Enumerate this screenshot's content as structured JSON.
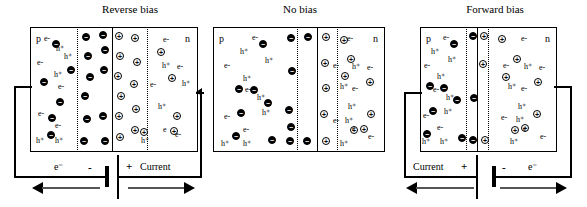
{
  "figure": {
    "panels": [
      {
        "id": "reverse-bias",
        "title": "Reverse bias",
        "p_label": "p",
        "n_label": "n",
        "box": {
          "x": 30,
          "y": 27,
          "w": 168,
          "h": 125
        },
        "depletion": {
          "left_line": 77,
          "junction": 112,
          "right_line": 147
        },
        "p_texts": [
          {
            "t": "e-",
            "x": 44,
            "y": 35
          },
          {
            "t": "h⁺",
            "x": 56,
            "y": 45
          },
          {
            "t": "h⁺",
            "x": 64,
            "y": 53
          },
          {
            "t": "e-",
            "x": 37,
            "y": 59
          },
          {
            "t": "h⁺",
            "x": 54,
            "y": 71
          },
          {
            "t": "e-",
            "x": 58,
            "y": 83
          },
          {
            "t": "e-",
            "x": 38,
            "y": 110
          },
          {
            "t": "e-",
            "x": 55,
            "y": 122
          },
          {
            "t": "h⁺",
            "x": 36,
            "y": 137
          },
          {
            "t": "h⁺",
            "x": 55,
            "y": 137
          }
        ],
        "n_texts": [
          {
            "t": "e-",
            "x": 163,
            "y": 36
          },
          {
            "t": "h⁺",
            "x": 162,
            "y": 62
          },
          {
            "t": "e-",
            "x": 177,
            "y": 63
          },
          {
            "t": "e-",
            "x": 150,
            "y": 81
          },
          {
            "t": "h⁺",
            "x": 182,
            "y": 80
          },
          {
            "t": "h⁺",
            "x": 158,
            "y": 103
          },
          {
            "t": "e",
            "x": 163,
            "y": 126
          },
          {
            "t": "h⁺",
            "x": 141,
            "y": 137
          },
          {
            "t": "e-",
            "x": 175,
            "y": 131
          }
        ],
        "neg_carriers": [
          {
            "x": 52,
            "y": 40
          },
          {
            "x": 67,
            "y": 66
          },
          {
            "x": 40,
            "y": 78
          },
          {
            "x": 56,
            "y": 98
          },
          {
            "x": 48,
            "y": 114
          },
          {
            "x": 47,
            "y": 131
          },
          {
            "x": 82,
            "y": 33
          },
          {
            "x": 84,
            "y": 52
          },
          {
            "x": 86,
            "y": 73
          },
          {
            "x": 81,
            "y": 92
          },
          {
            "x": 83,
            "y": 115
          },
          {
            "x": 80,
            "y": 137
          },
          {
            "x": 99,
            "y": 31
          },
          {
            "x": 101,
            "y": 46
          },
          {
            "x": 100,
            "y": 66
          },
          {
            "x": 99,
            "y": 112
          },
          {
            "x": 101,
            "y": 137
          }
        ],
        "pos_carriers": [
          {
            "x": 115,
            "y": 32
          },
          {
            "x": 116,
            "y": 52
          },
          {
            "x": 114,
            "y": 72
          },
          {
            "x": 117,
            "y": 92
          },
          {
            "x": 115,
            "y": 112
          },
          {
            "x": 116,
            "y": 133
          },
          {
            "x": 131,
            "y": 34
          },
          {
            "x": 133,
            "y": 58
          },
          {
            "x": 130,
            "y": 80
          },
          {
            "x": 132,
            "y": 105
          },
          {
            "x": 131,
            "y": 126
          },
          {
            "x": 140,
            "y": 128
          },
          {
            "x": 157,
            "y": 48
          },
          {
            "x": 168,
            "y": 74
          },
          {
            "x": 173,
            "y": 112
          },
          {
            "x": 170,
            "y": 127
          }
        ],
        "circuit": {
          "e_label": "e⁻",
          "minus": "-",
          "plus": "+",
          "current_label": "Current"
        }
      },
      {
        "id": "no-bias",
        "title": "No bias",
        "p_label": "p",
        "n_label": "n",
        "box": {
          "x": 213,
          "y": 27,
          "w": 172,
          "h": 125
        },
        "depletion": {
          "left_line": 297,
          "junction": 317,
          "right_line": 337
        },
        "p_texts": [
          {
            "t": "e-",
            "x": 252,
            "y": 34
          },
          {
            "t": "h⁺",
            "x": 240,
            "y": 48
          },
          {
            "t": "h⁺",
            "x": 265,
            "y": 57
          },
          {
            "t": "e-",
            "x": 224,
            "y": 62
          },
          {
            "t": "h⁺",
            "x": 243,
            "y": 75
          },
          {
            "t": "e-",
            "x": 245,
            "y": 86
          },
          {
            "t": "h⁺",
            "x": 257,
            "y": 94
          },
          {
            "t": "h⁺",
            "x": 262,
            "y": 109
          },
          {
            "t": "e-",
            "x": 224,
            "y": 113
          },
          {
            "t": "e-",
            "x": 243,
            "y": 126
          },
          {
            "t": "h⁺",
            "x": 221,
            "y": 140
          },
          {
            "t": "h⁺",
            "x": 243,
            "y": 140
          }
        ],
        "n_texts": [
          {
            "t": "e-",
            "x": 347,
            "y": 35
          },
          {
            "t": "h⁺",
            "x": 352,
            "y": 63
          },
          {
            "t": "e-",
            "x": 367,
            "y": 64
          },
          {
            "t": "e-",
            "x": 333,
            "y": 62
          },
          {
            "t": "h⁺",
            "x": 340,
            "y": 83
          },
          {
            "t": "e-",
            "x": 352,
            "y": 85
          },
          {
            "t": "h⁺",
            "x": 348,
            "y": 103
          },
          {
            "t": "e-",
            "x": 333,
            "y": 117
          },
          {
            "t": "h⁺",
            "x": 345,
            "y": 117
          },
          {
            "t": "e",
            "x": 352,
            "y": 125
          },
          {
            "t": "h⁺",
            "x": 340,
            "y": 140
          },
          {
            "t": "e-",
            "x": 368,
            "y": 133
          }
        ],
        "neg_carriers": [
          {
            "x": 259,
            "y": 40
          },
          {
            "x": 250,
            "y": 86
          },
          {
            "x": 264,
            "y": 99
          },
          {
            "x": 235,
            "y": 85
          },
          {
            "x": 237,
            "y": 109
          },
          {
            "x": 232,
            "y": 132
          },
          {
            "x": 268,
            "y": 136
          },
          {
            "x": 287,
            "y": 34
          },
          {
            "x": 288,
            "y": 67
          },
          {
            "x": 285,
            "y": 106
          },
          {
            "x": 287,
            "y": 123
          },
          {
            "x": 286,
            "y": 137
          },
          {
            "x": 304,
            "y": 33
          },
          {
            "x": 303,
            "y": 137
          }
        ],
        "pos_carriers": [
          {
            "x": 322,
            "y": 33
          },
          {
            "x": 321,
            "y": 59
          },
          {
            "x": 322,
            "y": 84
          },
          {
            "x": 320,
            "y": 110
          },
          {
            "x": 322,
            "y": 137
          },
          {
            "x": 340,
            "y": 36
          },
          {
            "x": 347,
            "y": 55
          },
          {
            "x": 341,
            "y": 72
          },
          {
            "x": 350,
            "y": 126
          },
          {
            "x": 360,
            "y": 125
          },
          {
            "x": 366,
            "y": 78
          },
          {
            "x": 367,
            "y": 110
          }
        ],
        "circuit": null
      },
      {
        "id": "forward-bias",
        "title": "Forward bias",
        "p_label": "p",
        "n_label": "n",
        "box": {
          "x": 420,
          "y": 27,
          "w": 137,
          "h": 125
        },
        "depletion": {
          "left_line": 466,
          "junction": 477,
          "right_line": 488
        },
        "p_texts": [
          {
            "t": "e-",
            "x": 443,
            "y": 34
          },
          {
            "t": "h⁺",
            "x": 431,
            "y": 48
          },
          {
            "t": "h⁺",
            "x": 448,
            "y": 56
          },
          {
            "t": "e-",
            "x": 424,
            "y": 62
          },
          {
            "t": "h⁺",
            "x": 437,
            "y": 73
          },
          {
            "t": "e-",
            "x": 433,
            "y": 86
          },
          {
            "t": "h⁺",
            "x": 446,
            "y": 94
          },
          {
            "t": "h⁺",
            "x": 444,
            "y": 108
          },
          {
            "t": "e-",
            "x": 423,
            "y": 112
          },
          {
            "t": "e-",
            "x": 437,
            "y": 124
          },
          {
            "t": "h⁺",
            "x": 422,
            "y": 138
          },
          {
            "t": "h⁺",
            "x": 440,
            "y": 138
          }
        ],
        "n_texts": [
          {
            "t": "e-",
            "x": 521,
            "y": 35
          },
          {
            "t": "h⁺",
            "x": 524,
            "y": 63
          },
          {
            "t": "e-",
            "x": 539,
            "y": 64
          },
          {
            "t": "e-",
            "x": 503,
            "y": 62
          },
          {
            "t": "h⁺",
            "x": 508,
            "y": 83
          },
          {
            "t": "e-",
            "x": 521,
            "y": 85
          },
          {
            "t": "h⁺",
            "x": 518,
            "y": 103
          },
          {
            "t": "e-",
            "x": 501,
            "y": 114
          },
          {
            "t": "h⁺",
            "x": 516,
            "y": 116
          },
          {
            "t": "e",
            "x": 523,
            "y": 125
          },
          {
            "t": "h⁺",
            "x": 510,
            "y": 138
          },
          {
            "t": "e-",
            "x": 540,
            "y": 133
          }
        ],
        "neg_carriers": [
          {
            "x": 450,
            "y": 40
          },
          {
            "x": 440,
            "y": 84
          },
          {
            "x": 453,
            "y": 96
          },
          {
            "x": 426,
            "y": 82
          },
          {
            "x": 429,
            "y": 107
          },
          {
            "x": 423,
            "y": 130
          },
          {
            "x": 458,
            "y": 134
          },
          {
            "x": 469,
            "y": 32
          },
          {
            "x": 470,
            "y": 94
          },
          {
            "x": 469,
            "y": 136
          }
        ],
        "pos_carriers": [
          {
            "x": 480,
            "y": 32
          },
          {
            "x": 479,
            "y": 60
          },
          {
            "x": 481,
            "y": 136
          },
          {
            "x": 498,
            "y": 35
          },
          {
            "x": 513,
            "y": 55
          },
          {
            "x": 502,
            "y": 73
          },
          {
            "x": 511,
            "y": 126
          },
          {
            "x": 521,
            "y": 124
          },
          {
            "x": 534,
            "y": 78
          },
          {
            "x": 533,
            "y": 110
          }
        ],
        "circuit": {
          "current_label": "Current",
          "plus": "+",
          "minus": "-",
          "e_label": "e⁻"
        }
      }
    ]
  }
}
